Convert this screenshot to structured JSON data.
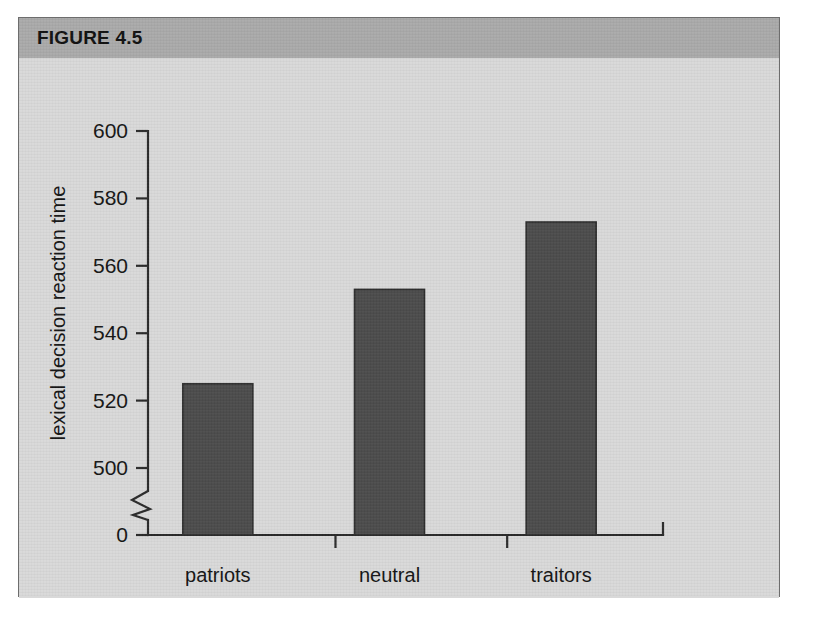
{
  "figure": {
    "title": "FIGURE 4.5",
    "header_color": "#aaaaaa",
    "panel_color": "#d9d9d9",
    "border_color": "#6d6d6d"
  },
  "chart_data": {
    "type": "bar",
    "title": "FIGURE 4.5",
    "xlabel": "",
    "ylabel": "lexical decision reaction time",
    "categories": [
      "patriots",
      "neutral",
      "traitors"
    ],
    "values": [
      525,
      553,
      573
    ],
    "ylim": [
      500,
      600
    ],
    "yticks": [
      0,
      500,
      520,
      540,
      560,
      580,
      600
    ],
    "ytick_labels": [
      "0",
      "500",
      "520",
      "540",
      "560",
      "580",
      "600"
    ],
    "axis_break": true,
    "axis_break_between": [
      0,
      500
    ],
    "grid": false,
    "legend": false,
    "bar_color": "#4c4c4c",
    "bar_edge_color": "#2e2e2e",
    "axis_color": "#2b2b2b"
  }
}
